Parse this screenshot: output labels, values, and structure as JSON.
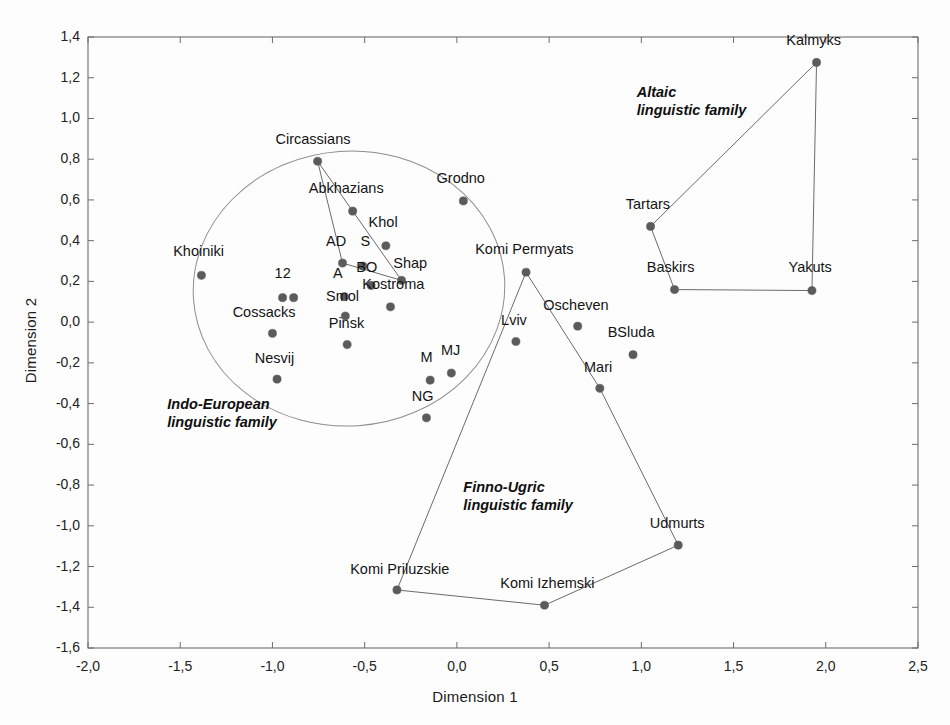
{
  "figure": {
    "background": "#fdfdfd",
    "axis_color": "#6d6d6d",
    "marker_color": "#5b5b5b",
    "line_color": "#6b6b6b",
    "ellipse_color": "#8d8d8d"
  },
  "chart_data": {
    "type": "scatter",
    "title": "",
    "xlabel": "Dimension 1",
    "ylabel": "Dimension 2",
    "xlim": [
      -2.0,
      2.5
    ],
    "ylim": [
      -1.6,
      1.4
    ],
    "xticks": [
      "-2,0",
      "-1,5",
      "-1,0",
      "-0,5",
      "0,0",
      "0,5",
      "1,0",
      "1,5",
      "2,0",
      "2,5"
    ],
    "xtick_values": [
      -2.0,
      -1.5,
      -1.0,
      -0.5,
      0.0,
      0.5,
      1.0,
      1.5,
      2.0,
      2.5
    ],
    "yticks": [
      "1,4",
      "1,2",
      "1,0",
      "0,8",
      "0,6",
      "0,4",
      "0,2",
      "0,0",
      "-0,2",
      "-0,4",
      "-0,6",
      "-0,8",
      "-1,0",
      "-1,2",
      "-1,4",
      "-1,6"
    ],
    "ytick_values": [
      1.4,
      1.2,
      1.0,
      0.8,
      0.6,
      0.4,
      0.2,
      0.0,
      -0.2,
      -0.4,
      -0.6,
      -0.8,
      -1.0,
      -1.2,
      -1.4,
      -1.6
    ],
    "grid": false,
    "legend": "none",
    "points": [
      {
        "label": "Circassians",
        "x": -0.755,
        "y": 0.79,
        "lx": -0.78,
        "ly": 0.875,
        "anchor": "middle"
      },
      {
        "label": "Abkhazians",
        "x": -0.565,
        "y": 0.545,
        "lx": -0.6,
        "ly": 0.635,
        "anchor": "middle"
      },
      {
        "label": "Grodno",
        "x": 0.035,
        "y": 0.595,
        "lx": 0.02,
        "ly": 0.685,
        "anchor": "middle"
      },
      {
        "label": "Khol",
        "x": -0.385,
        "y": 0.375,
        "lx": -0.4,
        "ly": 0.465,
        "anchor": "middle"
      },
      {
        "label": "AD",
        "x": -0.62,
        "y": 0.29,
        "lx": -0.655,
        "ly": 0.375,
        "anchor": "middle"
      },
      {
        "label": "S",
        "x": -0.51,
        "y": 0.275,
        "lx": -0.495,
        "ly": 0.375,
        "anchor": "middle"
      },
      {
        "label": "Shap",
        "x": -0.3,
        "y": 0.205,
        "lx": -0.345,
        "ly": 0.265,
        "anchor": "start"
      },
      {
        "label": "BO",
        "x": -0.465,
        "y": 0.18,
        "lx": -0.545,
        "ly": 0.245,
        "anchor": "start"
      },
      {
        "label": "Khoiniki",
        "x": -1.385,
        "y": 0.23,
        "lx": -1.4,
        "ly": 0.325,
        "anchor": "middle"
      },
      {
        "label": "Kostroma",
        "x": -0.36,
        "y": 0.075,
        "lx": -0.345,
        "ly": 0.165,
        "anchor": "middle"
      },
      {
        "label": "12",
        "x": -0.945,
        "y": 0.12,
        "lx": -0.945,
        "ly": 0.215,
        "anchor": "middle"
      },
      {
        "label": "12b",
        "x": -0.885,
        "y": 0.12,
        "lx": null,
        "ly": null,
        "anchor": "middle"
      },
      {
        "label": "A",
        "x": -0.61,
        "y": 0.125,
        "lx": -0.645,
        "ly": 0.215,
        "anchor": "middle"
      },
      {
        "label": "Smol",
        "x": -0.605,
        "y": 0.03,
        "lx": -0.62,
        "ly": 0.105,
        "anchor": "middle"
      },
      {
        "label": "Cossacks",
        "x": -1.0,
        "y": -0.055,
        "lx": -1.045,
        "ly": 0.025,
        "anchor": "middle"
      },
      {
        "label": "Pinsk",
        "x": -0.595,
        "y": -0.11,
        "lx": -0.6,
        "ly": -0.03,
        "anchor": "middle"
      },
      {
        "label": "Nesvij",
        "x": -0.975,
        "y": -0.28,
        "lx": -0.99,
        "ly": -0.2,
        "anchor": "middle"
      },
      {
        "label": "M",
        "x": -0.145,
        "y": -0.285,
        "lx": -0.165,
        "ly": -0.195,
        "anchor": "middle"
      },
      {
        "label": "MJ",
        "x": -0.03,
        "y": -0.25,
        "lx": -0.035,
        "ly": -0.16,
        "anchor": "middle"
      },
      {
        "label": "NG",
        "x": -0.165,
        "y": -0.47,
        "lx": -0.185,
        "ly": -0.385,
        "anchor": "middle"
      },
      {
        "label": "Komi Permyats",
        "x": 0.375,
        "y": 0.245,
        "lx": 0.365,
        "ly": 0.335,
        "anchor": "middle"
      },
      {
        "label": "Lviv",
        "x": 0.32,
        "y": -0.095,
        "lx": 0.31,
        "ly": -0.015,
        "anchor": "middle"
      },
      {
        "label": "Oscheven",
        "x": 0.655,
        "y": -0.02,
        "lx": 0.645,
        "ly": 0.06,
        "anchor": "middle"
      },
      {
        "label": "BSluda",
        "x": 0.955,
        "y": -0.16,
        "lx": 0.945,
        "ly": -0.075,
        "anchor": "middle"
      },
      {
        "label": "Mari",
        "x": 0.775,
        "y": -0.325,
        "lx": 0.765,
        "ly": -0.245,
        "anchor": "middle"
      },
      {
        "label": "Komi Priluzskie",
        "x": -0.325,
        "y": -1.315,
        "lx": -0.31,
        "ly": -1.235,
        "anchor": "middle"
      },
      {
        "label": "Komi Izhemski",
        "x": 0.475,
        "y": -1.39,
        "lx": 0.49,
        "ly": -1.305,
        "anchor": "middle"
      },
      {
        "label": "Udmurts",
        "x": 1.2,
        "y": -1.095,
        "lx": 1.195,
        "ly": -1.01,
        "anchor": "middle"
      },
      {
        "label": "Kalmyks",
        "x": 1.95,
        "y": 1.275,
        "lx": 1.935,
        "ly": 1.36,
        "anchor": "middle"
      },
      {
        "label": "Tartars",
        "x": 1.05,
        "y": 0.47,
        "lx": 1.035,
        "ly": 0.555,
        "anchor": "middle"
      },
      {
        "label": "Baskirs",
        "x": 1.18,
        "y": 0.16,
        "lx": 1.16,
        "ly": 0.245,
        "anchor": "middle"
      },
      {
        "label": "Yakuts",
        "x": 1.925,
        "y": 0.155,
        "lx": 1.915,
        "ly": 0.245,
        "anchor": "middle"
      }
    ],
    "connections": [
      {
        "from": "Circassians",
        "to": "AD"
      },
      {
        "from": "Circassians",
        "to": "Abkhazians"
      },
      {
        "from": "Abkhazians",
        "to": "Shap"
      },
      {
        "from": "AD",
        "to": "Shap"
      },
      {
        "from": "Komi Permyats",
        "to": "Komi Priluzskie"
      },
      {
        "from": "Komi Permyats",
        "to": "Mari"
      },
      {
        "from": "Mari",
        "to": "Udmurts"
      },
      {
        "from": "Udmurts",
        "to": "Komi Izhemski"
      },
      {
        "from": "Komi Izhemski",
        "to": "Komi Priluzskie"
      },
      {
        "from": "Kalmyks",
        "to": "Tartars"
      },
      {
        "from": "Kalmyks",
        "to": "Yakuts"
      },
      {
        "from": "Tartars",
        "to": "Baskirs"
      },
      {
        "from": "Baskirs",
        "to": "Yakuts"
      }
    ],
    "ellipses": [
      {
        "name": "indo-european-ellipse",
        "cx": -0.585,
        "cy": 0.165,
        "rx": 0.845,
        "ry": 0.675,
        "rotation": -4
      }
    ],
    "group_labels": [
      {
        "name": "altaic",
        "line1": "Altaic",
        "line2": "linguistic family",
        "x": 0.975,
        "y": 1.105
      },
      {
        "name": "indo-european",
        "line1": "Indo-European",
        "line2": "linguistic family",
        "x": -1.57,
        "y": -0.425
      },
      {
        "name": "finno-ugric",
        "line1": "Finno-Ugric",
        "line2": "linguistic family",
        "x": 0.035,
        "y": -0.835
      }
    ]
  }
}
